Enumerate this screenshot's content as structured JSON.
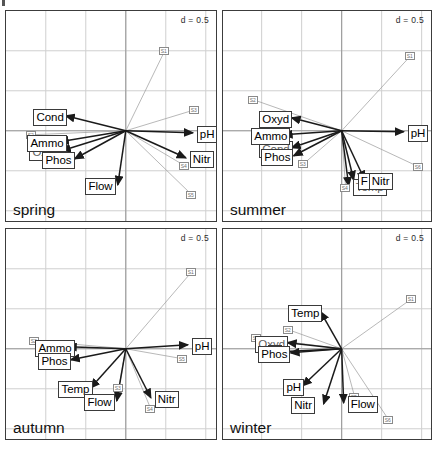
{
  "figure": {
    "type": "multi-panel-biplot",
    "panel_count": 4,
    "scale_annotation": "d = 0.5",
    "background_color": "#ffffff",
    "grid_color": "#cfcfcf",
    "arrow_color": "#1a1a1a",
    "link_color": "#9a9a9a",
    "frame_color": "#3c3c3c"
  },
  "panels": [
    {
      "id": "spring",
      "season_label": "spring",
      "scale_label": "d = 0.5",
      "variables": [
        {
          "name": "Cond",
          "label": "Cond",
          "x": -0.3,
          "y": 0.075,
          "hidden": false
        },
        {
          "name": "Ammo",
          "label": "Ammo",
          "x": -0.33,
          "y": -0.055,
          "hidden": false
        },
        {
          "name": "Oxyd",
          "label": "Oxyd",
          "x": -0.32,
          "y": -0.1,
          "hidden": true
        },
        {
          "name": "Phos",
          "label": "Phos",
          "x": -0.255,
          "y": -0.14,
          "hidden": false
        },
        {
          "name": "Flow",
          "label": "Flow",
          "x": -0.04,
          "y": -0.27,
          "hidden": false
        },
        {
          "name": "pH",
          "label": "pH",
          "x": 0.335,
          "y": -0.01,
          "hidden": false
        },
        {
          "name": "Nitr",
          "label": "Nitr",
          "x": 0.3,
          "y": -0.135,
          "hidden": false
        }
      ],
      "points": [
        {
          "label": "S1",
          "x": 0.195,
          "y": 0.4
        },
        {
          "label": "S2",
          "x": -0.47,
          "y": -0.02
        },
        {
          "label": "S3",
          "x": 0.345,
          "y": 0.105
        },
        {
          "label": "S4",
          "x": 0.295,
          "y": -0.175
        },
        {
          "label": "S5",
          "x": 0.33,
          "y": -0.32
        }
      ]
    },
    {
      "id": "summer",
      "season_label": "summer",
      "scale_label": "d = 0.5",
      "variables": [
        {
          "name": "Oxyd",
          "label": "Oxyd",
          "x": -0.25,
          "y": 0.065,
          "hidden": false
        },
        {
          "name": "Ammo",
          "label": "Ammo",
          "x": -0.29,
          "y": -0.02,
          "hidden": false
        },
        {
          "name": "Cond",
          "label": "Cond",
          "x": -0.25,
          "y": -0.085,
          "hidden": true
        },
        {
          "name": "Phos",
          "label": "Phos",
          "x": -0.24,
          "y": -0.125,
          "hidden": false
        },
        {
          "name": "pH",
          "label": "pH",
          "x": 0.31,
          "y": -0.005,
          "hidden": false
        },
        {
          "name": "Flow",
          "label": "F",
          "x": 0.06,
          "y": -0.245,
          "hidden": false
        },
        {
          "name": "Nitr",
          "label": "Nitr",
          "x": 0.115,
          "y": -0.245,
          "hidden": false
        },
        {
          "name": "Temp",
          "label": "Temp",
          "x": 0.035,
          "y": -0.275,
          "hidden": true
        }
      ],
      "points": [
        {
          "label": "S1",
          "x": 0.345,
          "y": 0.375
        },
        {
          "label": "S2",
          "x": -0.44,
          "y": 0.155
        },
        {
          "label": "S3",
          "x": -0.19,
          "y": -0.165
        },
        {
          "label": "S4",
          "x": 0.02,
          "y": -0.285
        },
        {
          "label": "S6",
          "x": 0.385,
          "y": -0.18
        }
      ]
    },
    {
      "id": "autumn",
      "season_label": "autumn",
      "scale_label": "d = 0.5",
      "variables": [
        {
          "name": "Ammo",
          "label": "Ammo",
          "x": -0.29,
          "y": 0.01,
          "hidden": false
        },
        {
          "name": "Phos",
          "label": "Phos",
          "x": -0.275,
          "y": -0.055,
          "hidden": false
        },
        {
          "name": "Temp",
          "label": "Temp",
          "x": -0.175,
          "y": -0.195,
          "hidden": false
        },
        {
          "name": "Flow",
          "label": "Flow",
          "x": -0.045,
          "y": -0.26,
          "hidden": false
        },
        {
          "name": "Nitr",
          "label": "Nitr",
          "x": 0.125,
          "y": -0.245,
          "hidden": false
        },
        {
          "name": "pH",
          "label": "pH",
          "x": 0.31,
          "y": 0.02,
          "hidden": false
        }
      ],
      "points": [
        {
          "label": "S1",
          "x": 0.33,
          "y": 0.385
        },
        {
          "label": "S2",
          "x": -0.455,
          "y": 0.04
        },
        {
          "label": "S3",
          "x": -0.035,
          "y": -0.195
        },
        {
          "label": "S4",
          "x": 0.125,
          "y": -0.3
        },
        {
          "label": "S5",
          "x": 0.285,
          "y": -0.05
        }
      ]
    },
    {
      "id": "winter",
      "season_label": "winter",
      "scale_label": "d = 0.5",
      "variables": [
        {
          "name": "Temp",
          "label": "Temp",
          "x": -0.105,
          "y": 0.185,
          "hidden": false
        },
        {
          "name": "Oxyd",
          "label": "Oxyd",
          "x": -0.27,
          "y": 0.03,
          "hidden": true
        },
        {
          "name": "Ammo",
          "label": "A",
          "x": -0.305,
          "y": -0.015,
          "hidden": false
        },
        {
          "name": "Phos",
          "label": "Phos",
          "x": -0.255,
          "y": -0.02,
          "hidden": false
        },
        {
          "name": "pH",
          "label": "pH",
          "x": -0.195,
          "y": -0.185,
          "hidden": false
        },
        {
          "name": "Nitr",
          "label": "Nitr",
          "x": -0.09,
          "y": -0.275,
          "hidden": false
        },
        {
          "name": "Flow",
          "label": "Flow",
          "x": 0.01,
          "y": -0.27,
          "hidden": false
        }
      ],
      "points": [
        {
          "label": "S1",
          "x": 0.35,
          "y": 0.25
        },
        {
          "label": "S2",
          "x": -0.265,
          "y": 0.095
        },
        {
          "label": "S3",
          "x": -0.425,
          "y": 0.055
        },
        {
          "label": "S5",
          "x": 0.065,
          "y": -0.24
        },
        {
          "label": "S6",
          "x": 0.235,
          "y": -0.355
        }
      ]
    }
  ],
  "chart_data": {
    "type": "scatter",
    "title": "",
    "xlabel": "",
    "ylabel": "",
    "grid": true,
    "legend": "none",
    "scale_bar": "d = 0.5",
    "axis_note": "arrows = environmental variables, boxed codes = sample sites"
  }
}
